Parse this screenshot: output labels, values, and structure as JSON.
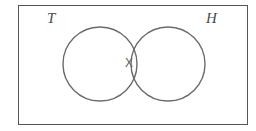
{
  "figure": {
    "kind": "venn-diagram",
    "background_color": "#ffffff",
    "frame": {
      "border_color": "#555555",
      "border_width_px": 1,
      "fill_color": "#ffffff",
      "x": 18,
      "y": 5,
      "width": 230,
      "height": 120
    },
    "circles": [
      {
        "set_label": "T",
        "name": "left-circle",
        "cx": 100,
        "cy": 64,
        "r": 37,
        "stroke_color": "#6b6b6b",
        "stroke_width_px": 1.4,
        "fill": "none"
      },
      {
        "set_label": "H",
        "name": "right-circle",
        "cx": 168,
        "cy": 64,
        "r": 37,
        "stroke_color": "#6b6b6b",
        "stroke_width_px": 1.4,
        "fill": "none"
      }
    ],
    "labels": {
      "left_set": "T",
      "right_set": "H",
      "intersection_marker": "X"
    },
    "label_colors": {
      "set_label_color": "#4a4a4a",
      "marker_color": "#5d5d5d"
    }
  }
}
